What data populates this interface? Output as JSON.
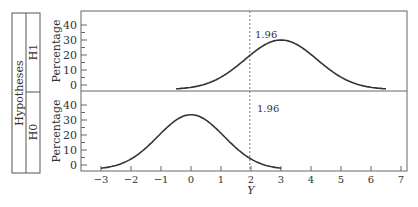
{
  "chart_data": {
    "type": "line",
    "title": "",
    "xlabel": "Y",
    "ylabel": "Percentage",
    "facet_label": "Hypotheses",
    "xlim": [
      -3.3,
      7.2
    ],
    "xticks": [
      -3,
      -2,
      -1,
      0,
      1,
      2,
      3,
      4,
      5,
      6,
      7
    ],
    "xtick_labels": [
      "−3",
      "−2",
      "−1",
      "0",
      "1",
      "2",
      "3",
      "4",
      "5",
      "6",
      "7"
    ],
    "ylim": [
      -5,
      48
    ],
    "yticks": [
      0,
      10,
      20,
      30,
      40
    ],
    "ytick_labels": [
      "0",
      "10",
      "20",
      "30",
      "40"
    ],
    "grid": false,
    "legend": null,
    "panels": [
      {
        "name": "H1",
        "distribution": "normal",
        "mean": 3,
        "sd": 1.2,
        "peak_percentage": 33,
        "x_range": [
          -0.5,
          6.5
        ],
        "critical_value": 1.96,
        "annotation": "1.96"
      },
      {
        "name": "H0",
        "distribution": "normal",
        "mean": 0,
        "sd": 1.1,
        "peak_percentage": 36.5,
        "x_range": [
          -3.0,
          3.0
        ],
        "critical_value": 1.96,
        "annotation": "1.96"
      }
    ],
    "series": [
      {
        "name": "H1",
        "x": [
          -0.5,
          0,
          0.5,
          1,
          1.5,
          2,
          2.5,
          3,
          3.5,
          4,
          4.5,
          5,
          5.5,
          6,
          6.5
        ],
        "values": [
          0.4,
          1.4,
          3.5,
          7.4,
          13.1,
          19.9,
          26.9,
          33,
          30.1,
          23.8,
          15.9,
          8.9,
          4.2,
          1.8,
          0.5
        ]
      },
      {
        "name": "H0",
        "x": [
          -3,
          -2.5,
          -2,
          -1.5,
          -1,
          -0.5,
          0,
          0.5,
          1,
          1.5,
          2,
          2.5,
          3
        ],
        "values": [
          0.8,
          2.7,
          7.2,
          14.7,
          24.1,
          33.2,
          36.5,
          33.2,
          24.1,
          14.7,
          7.2,
          2.7,
          0.8
        ]
      }
    ]
  }
}
